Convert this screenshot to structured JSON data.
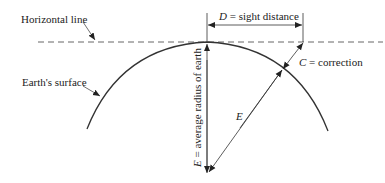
{
  "diagram": {
    "labels": {
      "horizontal_line": "Horizontal line",
      "earths_surface": "Earth's surface",
      "d_symbol": "D",
      "d_text": " = sight distance",
      "c_symbol": "C",
      "c_text": " = correction",
      "e_symbol": "E",
      "e_vertical_text": " = average radius of earth",
      "e_diag": "E"
    },
    "colors": {
      "line": "#333333",
      "dashed": "#666666",
      "text": "#222222",
      "background": "#ffffff"
    }
  }
}
